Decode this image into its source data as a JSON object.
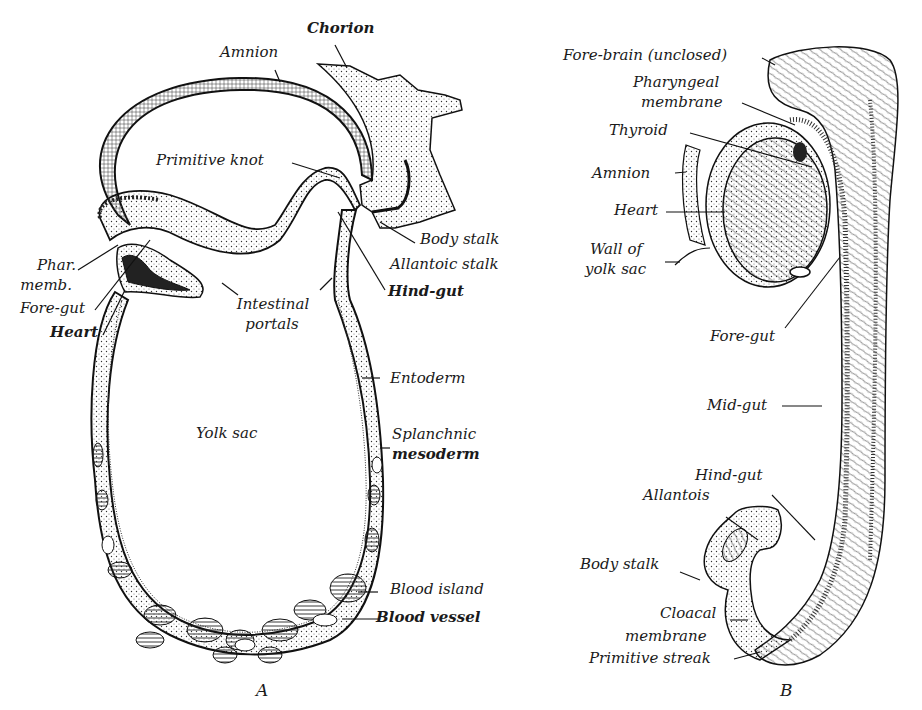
{
  "figure": {
    "panel_a": {
      "letter": "A",
      "labels": {
        "chorion": "Chorion",
        "amnion": "Amnion",
        "primitive_knot": "Primitive knot",
        "phar_memb_1": "Phar.",
        "phar_memb_2": "memb.",
        "fore_gut": "Fore-gut",
        "heart": "Heart",
        "intestinal_portals_1": "Intestinal",
        "intestinal_portals_2": "portals",
        "body_stalk": "Body stalk",
        "allantoic_stalk": "Allantoic stalk",
        "hind_gut": "Hind-gut",
        "entoderm": "Entoderm",
        "yolk_sac": "Yolk sac",
        "splanchnic_1": "Splanchnic",
        "splanchnic_2": "mesoderm",
        "blood_island": "Blood island",
        "blood_vessel": "Blood vessel"
      }
    },
    "panel_b": {
      "letter": "B",
      "labels": {
        "fore_brain": "Fore-brain (unclosed)",
        "pharyngeal_1": "Pharyngeal",
        "pharyngeal_2": "membrane",
        "thyroid": "Thyroid",
        "amnion": "Amnion",
        "heart": "Heart",
        "wall_1": "Wall of",
        "wall_2": "yolk sac",
        "fore_gut": "Fore-gut",
        "mid_gut": "Mid-gut",
        "hind_gut": "Hind-gut",
        "allantois": "Allantois",
        "body_stalk": "Body stalk",
        "cloacal_1": "Cloacal",
        "cloacal_2": "membrane",
        "primitive_streak": "Primitive streak"
      }
    }
  }
}
